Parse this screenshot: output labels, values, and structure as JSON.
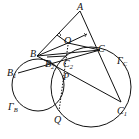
{
  "diagram": {
    "type": "geometry",
    "points": {
      "A": {
        "label": "A",
        "x": 80,
        "y": 11
      },
      "O": {
        "label": "O",
        "x": 68,
        "y": 43
      },
      "B": {
        "label": "B",
        "x": 37,
        "y": 56
      },
      "C": {
        "label": "C",
        "x": 100,
        "y": 50
      },
      "B1": {
        "label": "B",
        "sub": "1",
        "x": 18,
        "y": 73
      },
      "B2": {
        "label": "B",
        "sub": "2",
        "x": 47,
        "y": 57
      },
      "C1": {
        "label": "C",
        "sub": "1",
        "x": 121,
        "y": 102
      },
      "C2": {
        "label": "C",
        "sub": "2",
        "x": 65,
        "y": 57
      },
      "P": {
        "label": "P",
        "x": 65,
        "y": 76
      },
      "Q": {
        "label": "Q",
        "x": 58,
        "y": 113
      }
    },
    "circles": [
      {
        "name": "Gamma_B",
        "label": "Γ",
        "sub": "B",
        "cx": 38,
        "cy": 85,
        "r": 26
      },
      {
        "name": "Gamma_C",
        "label": "Γ",
        "sub": "C",
        "cx": 91,
        "cy": 88,
        "r": 40
      }
    ],
    "circle_labels": {
      "Gamma_B": {
        "text": "Γ",
        "sub": "B",
        "x": 10,
        "y": 110
      },
      "Gamma_C": {
        "text": "Γ",
        "sub": "C",
        "x": 118,
        "y": 64
      }
    },
    "stroke_color": "#111111"
  }
}
